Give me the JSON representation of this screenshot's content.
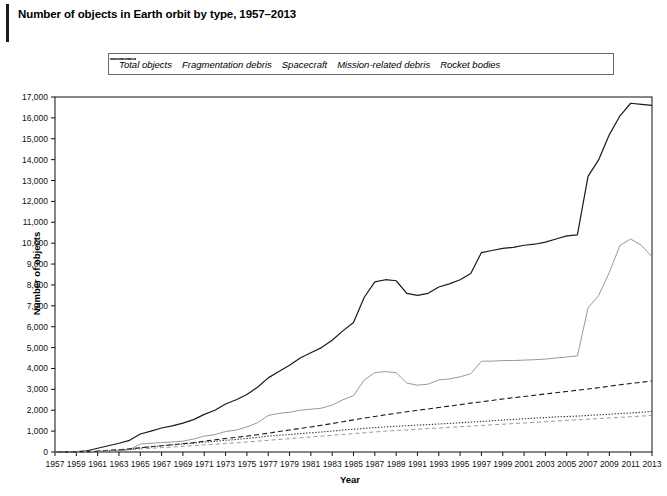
{
  "title": "Number of objects in Earth orbit by type, 1957–2013",
  "axes": {
    "xlabel": "Year",
    "ylabel": "Number of objects",
    "xlim": [
      1957,
      2013
    ],
    "ylim": [
      0,
      17000
    ],
    "xticks": [
      1957,
      1959,
      1961,
      1963,
      1965,
      1967,
      1969,
      1971,
      1973,
      1975,
      1977,
      1979,
      1981,
      1983,
      1985,
      1987,
      1989,
      1991,
      1993,
      1995,
      1997,
      1999,
      2001,
      2003,
      2005,
      2007,
      2009,
      2011,
      2013
    ],
    "xticklabels": [
      "1957",
      "1959",
      "1961",
      "1963",
      "1965",
      "1967",
      "1969",
      "1971",
      "1973",
      "1975",
      "1977",
      "1979",
      "1981",
      "1983",
      "1985",
      "1987",
      "1989",
      "1991",
      "1993",
      "1995",
      "1997",
      "1999",
      "2001",
      "2003",
      "2005",
      "2007",
      "2009",
      "2011",
      "2013"
    ],
    "yticks": [
      0,
      1000,
      2000,
      3000,
      4000,
      5000,
      6000,
      7000,
      8000,
      9000,
      10000,
      11000,
      12000,
      13000,
      14000,
      15000,
      16000,
      17000
    ],
    "yticklabels": [
      "0",
      "1,000",
      "2,000",
      "3,000",
      "4,000",
      "5,000",
      "6,000",
      "7,000",
      "8,000",
      "9,000",
      "10,000",
      "11,000",
      "12,000",
      "13,000",
      "14,000",
      "15,000",
      "16,000",
      "17,000"
    ],
    "grid": false
  },
  "legend": {
    "position": "top-center",
    "entries": [
      {
        "label": "Total objects",
        "style": "solid",
        "color": "#1a1a1a"
      },
      {
        "label": "Fragmentation debris",
        "style": "solid-light",
        "color": "#8c8c8c"
      },
      {
        "label": "Spacecraft",
        "style": "dashed",
        "color": "#1a1a1a"
      },
      {
        "label": "Mission-related debris",
        "style": "dotted",
        "color": "#3a3a3a"
      },
      {
        "label": "Rocket bodies",
        "style": "dash-light",
        "color": "#8c8c8c"
      }
    ]
  },
  "chart_data": {
    "type": "line",
    "title": "Number of objects in Earth orbit by type, 1957–2013",
    "xlabel": "Year",
    "ylabel": "Number of objects",
    "xlim": [
      1957,
      2013
    ],
    "ylim": [
      0,
      17000
    ],
    "x": [
      1957,
      1958,
      1959,
      1960,
      1961,
      1962,
      1963,
      1964,
      1965,
      1966,
      1967,
      1968,
      1969,
      1970,
      1971,
      1972,
      1973,
      1974,
      1975,
      1976,
      1977,
      1978,
      1979,
      1980,
      1981,
      1982,
      1983,
      1984,
      1985,
      1986,
      1987,
      1988,
      1989,
      1990,
      1991,
      1992,
      1993,
      1994,
      1995,
      1996,
      1997,
      1998,
      1999,
      2000,
      2001,
      2002,
      2003,
      2004,
      2005,
      2006,
      2007,
      2008,
      2009,
      2010,
      2011,
      2012,
      2013
    ],
    "series": [
      {
        "name": "Total objects",
        "style": "solid",
        "color": "#1a1a1a",
        "values": [
          2,
          10,
          25,
          60,
          180,
          300,
          420,
          560,
          860,
          1000,
          1150,
          1250,
          1380,
          1550,
          1800,
          2000,
          2300,
          2500,
          2750,
          3100,
          3550,
          3850,
          4150,
          4500,
          4750,
          5000,
          5350,
          5800,
          6200,
          7400,
          8150,
          8250,
          8200,
          7600,
          7500,
          7600,
          7900,
          8050,
          8250,
          8550,
          9550,
          9650,
          9750,
          9800,
          9900,
          9950,
          10050,
          10200,
          10350,
          10400,
          13200,
          14000,
          15200,
          16100,
          16700,
          16650,
          16600
        ]
      },
      {
        "name": "Fragmentation debris",
        "style": "solid-light",
        "color": "#8c8c8c",
        "values": [
          0,
          0,
          0,
          0,
          20,
          40,
          60,
          120,
          380,
          420,
          450,
          480,
          520,
          620,
          760,
          830,
          980,
          1050,
          1200,
          1400,
          1750,
          1850,
          1900,
          2000,
          2050,
          2100,
          2250,
          2500,
          2700,
          3450,
          3800,
          3850,
          3800,
          3300,
          3200,
          3250,
          3450,
          3500,
          3600,
          3750,
          4350,
          4350,
          4380,
          4380,
          4400,
          4420,
          4450,
          4500,
          4550,
          4600,
          6900,
          7500,
          8600,
          9900,
          10200,
          9900,
          9350
        ]
      },
      {
        "name": "Spacecraft",
        "style": "dashed",
        "color": "#1a1a1a",
        "values": [
          1,
          5,
          10,
          20,
          45,
          80,
          110,
          150,
          200,
          250,
          300,
          350,
          400,
          450,
          520,
          580,
          650,
          700,
          760,
          830,
          900,
          980,
          1050,
          1130,
          1200,
          1280,
          1360,
          1450,
          1540,
          1620,
          1700,
          1780,
          1850,
          1930,
          2000,
          2060,
          2130,
          2200,
          2270,
          2340,
          2400,
          2470,
          2540,
          2600,
          2660,
          2720,
          2780,
          2840,
          2900,
          2960,
          3020,
          3080,
          3150,
          3220,
          3280,
          3340,
          3400
        ]
      },
      {
        "name": "Mission-related debris",
        "style": "dotted",
        "color": "#3a3a3a",
        "values": [
          0,
          2,
          5,
          12,
          30,
          60,
          90,
          130,
          200,
          250,
          300,
          340,
          380,
          420,
          470,
          510,
          560,
          600,
          650,
          700,
          760,
          800,
          840,
          880,
          920,
          960,
          1000,
          1050,
          1090,
          1130,
          1170,
          1200,
          1230,
          1260,
          1290,
          1310,
          1340,
          1370,
          1400,
          1430,
          1460,
          1500,
          1530,
          1560,
          1590,
          1620,
          1650,
          1680,
          1700,
          1720,
          1750,
          1780,
          1810,
          1840,
          1870,
          1900,
          1950
        ]
      },
      {
        "name": "Rocket bodies",
        "style": "dash-light",
        "color": "#8c8c8c",
        "values": [
          1,
          3,
          8,
          15,
          35,
          55,
          80,
          110,
          150,
          180,
          210,
          240,
          270,
          300,
          340,
          370,
          410,
          440,
          480,
          520,
          560,
          600,
          640,
          680,
          720,
          760,
          800,
          840,
          880,
          920,
          960,
          1000,
          1030,
          1060,
          1090,
          1120,
          1150,
          1180,
          1210,
          1240,
          1270,
          1300,
          1330,
          1360,
          1390,
          1420,
          1450,
          1480,
          1510,
          1540,
          1570,
          1600,
          1630,
          1660,
          1690,
          1720,
          1750
        ]
      }
    ]
  }
}
